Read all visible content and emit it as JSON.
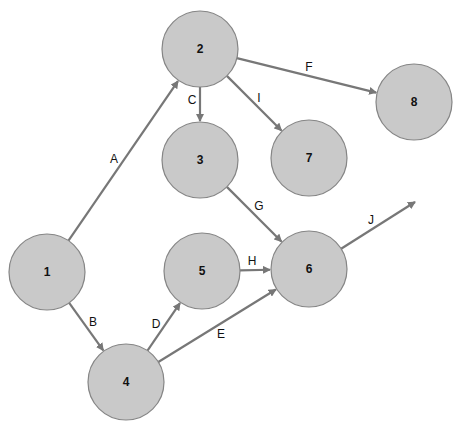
{
  "diagram": {
    "type": "activity-on-arrow network",
    "node_radius": 38,
    "colors": {
      "node_fill": "#c9c9c9",
      "node_stroke": "#858585",
      "edge": "#777777",
      "text": "#111111"
    },
    "nodes": [
      {
        "id": "1",
        "label": "1",
        "x": 47,
        "y": 272
      },
      {
        "id": "2",
        "label": "2",
        "x": 200,
        "y": 49
      },
      {
        "id": "3",
        "label": "3",
        "x": 200,
        "y": 160
      },
      {
        "id": "4",
        "label": "4",
        "x": 126,
        "y": 382
      },
      {
        "id": "5",
        "label": "5",
        "x": 202,
        "y": 271
      },
      {
        "id": "6",
        "label": "6",
        "x": 309,
        "y": 269
      },
      {
        "id": "7",
        "label": "7",
        "x": 309,
        "y": 158
      },
      {
        "id": "8",
        "label": "8",
        "x": 414,
        "y": 102
      }
    ],
    "edges": [
      {
        "label": "A",
        "from": "1",
        "to": "2",
        "lx": 114,
        "ly": 159
      },
      {
        "label": "B",
        "from": "1",
        "to": "4",
        "lx": 93,
        "ly": 322
      },
      {
        "label": "C",
        "from": "2",
        "to": "3",
        "lx": 192,
        "ly": 100
      },
      {
        "label": "D",
        "from": "4",
        "to": "5",
        "lx": 156,
        "ly": 324
      },
      {
        "label": "E",
        "from": "4",
        "to": "6",
        "lx": 221,
        "ly": 334
      },
      {
        "label": "F",
        "from": "2",
        "to": "8",
        "lx": 309,
        "ly": 67
      },
      {
        "label": "G",
        "from": "3",
        "to": "6",
        "lx": 259,
        "ly": 206
      },
      {
        "label": "H",
        "from": "5",
        "to": "6",
        "lx": 252,
        "ly": 261
      },
      {
        "label": "I",
        "from": "2",
        "to": "7",
        "lx": 259,
        "ly": 98
      },
      {
        "label": "J",
        "from": "6",
        "to": null,
        "end_x": 415,
        "end_y": 202,
        "lx": 371,
        "ly": 220
      }
    ]
  }
}
